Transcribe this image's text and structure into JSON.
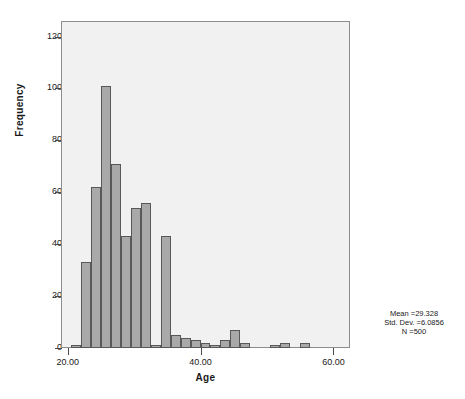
{
  "chart_data": {
    "type": "bar",
    "title": "",
    "subtitle": "",
    "xlabel": "Age",
    "ylabel": "Frequency",
    "xlim": [
      19.0,
      62.5
    ],
    "ylim": [
      0,
      126
    ],
    "grid": false,
    "legend": "none",
    "bin_width": 1.5,
    "bin_starts": [
      20.5,
      22.0,
      23.5,
      25.0,
      26.5,
      28.0,
      29.5,
      31.0,
      32.5,
      34.0,
      35.5,
      37.0,
      38.5,
      40.0,
      41.5,
      43.0,
      44.5,
      46.0,
      47.5,
      49.0,
      50.5,
      52.0,
      53.5,
      55.0,
      56.5,
      58.0,
      59.5
    ],
    "categories": [
      "20.5",
      "22.0",
      "23.5",
      "25.0",
      "26.5",
      "28.0",
      "29.5",
      "31.0",
      "32.5",
      "34.0",
      "35.5",
      "37.0",
      "38.5",
      "40.0",
      "41.5",
      "43.0",
      "44.5",
      "46.0",
      "47.5",
      "49.0",
      "50.5",
      "52.0",
      "53.5",
      "55.0",
      "56.5",
      "58.0",
      "59.5"
    ],
    "values": [
      1,
      33,
      62,
      101,
      71,
      43,
      54,
      56,
      1,
      43,
      5,
      4,
      3,
      2,
      1,
      3,
      7,
      2,
      0,
      0,
      1,
      2,
      0,
      2,
      0,
      0,
      0
    ],
    "x_ticks": [
      {
        "value": 20,
        "label": "20.00"
      },
      {
        "value": 40,
        "label": "40.00"
      },
      {
        "value": 60,
        "label": "60.00"
      }
    ],
    "y_ticks": [
      {
        "value": 0,
        "label": "0"
      },
      {
        "value": 20,
        "label": "20"
      },
      {
        "value": 40,
        "label": "40"
      },
      {
        "value": 60,
        "label": "60"
      },
      {
        "value": 80,
        "label": "80"
      },
      {
        "value": 100,
        "label": "100"
      },
      {
        "value": 120,
        "label": "120"
      }
    ],
    "annotations": {
      "mean_line": "Mean =29.328",
      "stddev_line": "Std. Dev. =6.0856",
      "n_line": "N =500"
    },
    "colors": {
      "bar_fill": "#a9a9a9",
      "bar_border": "#58585a",
      "plot_background": "#f1f1f1",
      "frame_border": "#8d8d8d",
      "text": "#1a1a1a",
      "page_background": "#ffffff"
    }
  },
  "statistics": {
    "mean": 29.328,
    "std_dev": 6.0856,
    "n": 500
  }
}
